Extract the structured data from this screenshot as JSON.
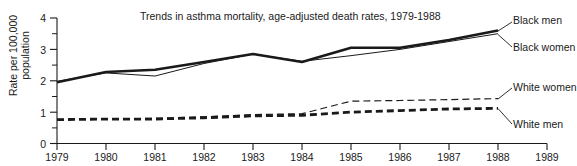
{
  "chart_data": {
    "type": "line",
    "title": "Trends in asthma mortality, age-adjusted death rates, 1979-1988",
    "xlabel": "",
    "ylabel": "Rate per 100,000 population",
    "ylabel_line1": "Rate per 100,000",
    "ylabel_line2": "population",
    "x": [
      1979,
      1980,
      1981,
      1982,
      1983,
      1984,
      1985,
      1986,
      1987,
      1988
    ],
    "xticks": [
      "1979",
      "1980",
      "1981",
      "1982",
      "1983",
      "1984",
      "1985",
      "1986",
      "1987",
      "1988",
      "1989"
    ],
    "xlim": [
      1979,
      1989
    ],
    "yticks": [
      "0",
      "1",
      "2",
      "3",
      "4"
    ],
    "yticks_minor": [
      0.5,
      1.5,
      2.5,
      3.5
    ],
    "ylim": [
      0,
      4
    ],
    "grid": false,
    "legend_position": "right-inline-annotations",
    "series": [
      {
        "name": "Black men",
        "style": "solid-thick",
        "values": [
          1.95,
          2.28,
          2.35,
          2.6,
          2.85,
          2.6,
          3.05,
          3.05,
          3.3,
          3.6
        ]
      },
      {
        "name": "Black women",
        "style": "solid-thin",
        "values": [
          1.98,
          2.25,
          2.15,
          2.55,
          2.85,
          2.62,
          2.8,
          3.0,
          3.25,
          3.5
        ]
      },
      {
        "name": "White women",
        "style": "dashed-thin",
        "values": [
          0.77,
          0.79,
          0.8,
          0.85,
          0.92,
          0.95,
          1.35,
          1.37,
          1.4,
          1.43
        ]
      },
      {
        "name": "White men",
        "style": "dashed-thick",
        "values": [
          0.76,
          0.78,
          0.78,
          0.82,
          0.88,
          0.9,
          1.0,
          1.05,
          1.1,
          1.12
        ]
      }
    ],
    "annotations": [
      {
        "name": "Black men",
        "position": "top-right"
      },
      {
        "name": "Black women",
        "position": "upper-right"
      },
      {
        "name": "White women",
        "position": "mid-right"
      },
      {
        "name": "White men",
        "position": "lower-right"
      }
    ]
  }
}
